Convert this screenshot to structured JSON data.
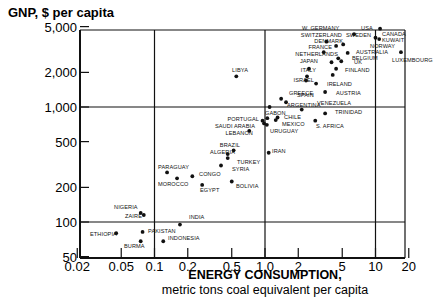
{
  "chart_data": {
    "type": "scatter",
    "title": "",
    "ylabel": "GNP, $ per capita",
    "xlabel": "ENERGY CONSUMPTION,",
    "xlabel_sub": "metric tons coal equivalent per capita",
    "xscale": "log",
    "yscale": "log",
    "xlim": [
      0.02,
      20
    ],
    "ylim": [
      50,
      5000
    ],
    "x_ticks": [
      {
        "value": 0.02,
        "label": "0.02"
      },
      {
        "value": 0.05,
        "label": "0.05"
      },
      {
        "value": 0.1,
        "label": "0.1"
      },
      {
        "value": 0.2,
        "label": "0.2"
      },
      {
        "value": 0.5,
        "label": "0.5"
      },
      {
        "value": 1.0,
        "label": "1.0"
      },
      {
        "value": 2,
        "label": "2"
      },
      {
        "value": 5,
        "label": "5"
      },
      {
        "value": 10,
        "label": "10"
      },
      {
        "value": 20,
        "label": "20"
      }
    ],
    "y_ticks": [
      {
        "value": 50,
        "label": "50"
      },
      {
        "value": 100,
        "label": "100"
      },
      {
        "value": 200,
        "label": "200"
      },
      {
        "value": 500,
        "label": "500"
      },
      {
        "value": 1000,
        "label": "1,000"
      },
      {
        "value": 2000,
        "label": "2,000"
      },
      {
        "value": 5000,
        "label": "5,000"
      }
    ],
    "gridlines": {
      "x": [
        0.1,
        1.0,
        10
      ],
      "y": [
        100,
        1000
      ]
    },
    "points": [
      {
        "name": "USA",
        "x": 11.0,
        "y": 4800
      },
      {
        "name": "CANADA",
        "x": 10.0,
        "y": 4000
      },
      {
        "name": "KUWAIT",
        "x": 10.8,
        "y": 3900
      },
      {
        "name": "LUXEMBOURG",
        "x": 17.0,
        "y": 3000
      },
      {
        "name": "W. GERMANY",
        "x": 5.1,
        "y": 3500
      },
      {
        "name": "SWITZERLAND",
        "x": 3.6,
        "y": 3700
      },
      {
        "name": "DENMARK",
        "x": 4.4,
        "y": 3400
      },
      {
        "name": "SWEDEN",
        "x": 6.4,
        "y": 4300
      },
      {
        "name": "FRANCE",
        "x": 3.4,
        "y": 3000
      },
      {
        "name": "NORWAY",
        "x": 5.6,
        "y": 2950
      },
      {
        "name": "AUSTRALIA",
        "x": 4.6,
        "y": 2650
      },
      {
        "name": "BELGIUM",
        "x": 4.9,
        "y": 2500
      },
      {
        "name": "NETHERLANDS",
        "x": 4.0,
        "y": 2450
      },
      {
        "name": "JAPAN",
        "x": 2.5,
        "y": 2150
      },
      {
        "name": "UK",
        "x": 4.4,
        "y": 2150
      },
      {
        "name": "FINLAND",
        "x": 4.1,
        "y": 1900
      },
      {
        "name": "ITALY",
        "x": 2.4,
        "y": 1850
      },
      {
        "name": "ISRAEL",
        "x": 2.35,
        "y": 1700
      },
      {
        "name": "IRELAND",
        "x": 2.9,
        "y": 1600
      },
      {
        "name": "AUSTRIA",
        "x": 3.5,
        "y": 1350
      },
      {
        "name": "LIBYA",
        "x": 0.55,
        "y": 1850
      },
      {
        "name": "GREECE",
        "x": 1.4,
        "y": 1180
      },
      {
        "name": "SPAIN",
        "x": 1.55,
        "y": 1100
      },
      {
        "name": "ARGENTINA",
        "x": 1.1,
        "y": 1000
      },
      {
        "name": "VENEZUELA",
        "x": 2.15,
        "y": 950
      },
      {
        "name": "TRINIDAD",
        "x": 3.5,
        "y": 880
      },
      {
        "name": "GABON",
        "x": 1.05,
        "y": 800
      },
      {
        "name": "CHILE",
        "x": 1.3,
        "y": 810
      },
      {
        "name": "MEXICO",
        "x": 1.25,
        "y": 770
      },
      {
        "name": "PORTUGAL",
        "x": 0.95,
        "y": 760
      },
      {
        "name": "SAUDI ARABIA",
        "x": 0.98,
        "y": 720
      },
      {
        "name": "URUGUAY",
        "x": 1.04,
        "y": 700
      },
      {
        "name": "S. AFRICA",
        "x": 2.85,
        "y": 760
      },
      {
        "name": "LEBANON",
        "x": 0.72,
        "y": 620
      },
      {
        "name": "BRAZIL",
        "x": 0.52,
        "y": 420
      },
      {
        "name": "ALGERIA",
        "x": 0.46,
        "y": 390
      },
      {
        "name": "TURKEY",
        "x": 0.46,
        "y": 360
      },
      {
        "name": "IRAN",
        "x": 1.08,
        "y": 400
      },
      {
        "name": "SYRIA",
        "x": 0.4,
        "y": 310
      },
      {
        "name": "PARAGUAY",
        "x": 0.13,
        "y": 270
      },
      {
        "name": "CONGO",
        "x": 0.22,
        "y": 250
      },
      {
        "name": "MOROCCO",
        "x": 0.16,
        "y": 240
      },
      {
        "name": "EGYPT",
        "x": 0.27,
        "y": 210
      },
      {
        "name": "BOLIVIA",
        "x": 0.5,
        "y": 225
      },
      {
        "name": "NIGERIA",
        "x": 0.075,
        "y": 120
      },
      {
        "name": "ZAIRE",
        "x": 0.08,
        "y": 115
      },
      {
        "name": "INDIA",
        "x": 0.17,
        "y": 95
      },
      {
        "name": "ETHIOPIA",
        "x": 0.045,
        "y": 80
      },
      {
        "name": "PAKISTAN",
        "x": 0.078,
        "y": 82
      },
      {
        "name": "BURMA",
        "x": 0.075,
        "y": 68
      },
      {
        "name": "INDONESIA",
        "x": 0.12,
        "y": 68
      }
    ]
  },
  "labels": [
    {
      "name": "USA",
      "lx": 361,
      "ly": 30,
      "anchor": "start"
    },
    {
      "name": "CANADA",
      "lx": 382,
      "ly": 36,
      "anchor": "start"
    },
    {
      "name": "KUWAIT",
      "lx": 382,
      "ly": 42,
      "anchor": "start"
    },
    {
      "name": "LUXEMBOURG",
      "lx": 392,
      "ly": 62,
      "anchor": "start"
    },
    {
      "name": "W. GERMANY",
      "lx": 302,
      "ly": 30,
      "anchor": "start"
    },
    {
      "name": "SWITZERLAND",
      "lx": 342,
      "ly": 37,
      "anchor": "end"
    },
    {
      "name": "DENMARK",
      "lx": 343,
      "ly": 43,
      "anchor": "end"
    },
    {
      "name": "SWEDEN",
      "lx": 346,
      "ly": 37,
      "anchor": "start"
    },
    {
      "name": "FRANCE",
      "lx": 332,
      "ly": 49,
      "anchor": "end"
    },
    {
      "name": "NORWAY",
      "lx": 370,
      "ly": 48,
      "anchor": "start"
    },
    {
      "name": "AUSTRALIA",
      "lx": 356,
      "ly": 54,
      "anchor": "start"
    },
    {
      "name": "BELGIUM",
      "lx": 352,
      "ly": 60,
      "anchor": "start"
    },
    {
      "name": "NETHERLANDS",
      "lx": 338,
      "ly": 56,
      "anchor": "end"
    },
    {
      "name": "JAPAN",
      "lx": 318,
      "ly": 63,
      "anchor": "end"
    },
    {
      "name": "UK",
      "lx": 354,
      "ly": 64,
      "anchor": "start"
    },
    {
      "name": "FINLAND",
      "lx": 345,
      "ly": 72,
      "anchor": "start"
    },
    {
      "name": "ITALY",
      "lx": 316,
      "ly": 72,
      "anchor": "end"
    },
    {
      "name": "ISRAEL",
      "lx": 314,
      "ly": 82,
      "anchor": "end"
    },
    {
      "name": "IRELAND",
      "lx": 327,
      "ly": 86,
      "anchor": "start"
    },
    {
      "name": "AUSTRIA",
      "lx": 336,
      "ly": 95,
      "anchor": "start"
    },
    {
      "name": "LIBYA",
      "lx": 248,
      "ly": 72,
      "anchor": "end"
    },
    {
      "name": "GREECE",
      "lx": 289,
      "ly": 95,
      "anchor": "start"
    },
    {
      "name": "SPAIN",
      "lx": 297,
      "ly": 97,
      "anchor": "start"
    },
    {
      "name": "ARGENTINA",
      "lx": 287,
      "ly": 107,
      "anchor": "start"
    },
    {
      "name": "VENEZUELA",
      "lx": 317,
      "ly": 105,
      "anchor": "start"
    },
    {
      "name": "TRINIDAD",
      "lx": 335,
      "ly": 114,
      "anchor": "start"
    },
    {
      "name": "GABON",
      "lx": 265,
      "ly": 115,
      "anchor": "start"
    },
    {
      "name": "CHILE",
      "lx": 284,
      "ly": 119,
      "anchor": "start"
    },
    {
      "name": "MEXICO",
      "lx": 282,
      "ly": 126,
      "anchor": "start"
    },
    {
      "name": "PORTUGAL",
      "lx": 259,
      "ly": 121,
      "anchor": "end"
    },
    {
      "name": "SAUDI ARABIA",
      "lx": 255,
      "ly": 128,
      "anchor": "end"
    },
    {
      "name": "URUGUAY",
      "lx": 270,
      "ly": 133,
      "anchor": "start"
    },
    {
      "name": "S. AFRICA",
      "lx": 316,
      "ly": 128,
      "anchor": "start"
    },
    {
      "name": "LEBANON",
      "lx": 253,
      "ly": 135,
      "anchor": "end"
    },
    {
      "name": "BRAZIL",
      "lx": 240,
      "ly": 147,
      "anchor": "end"
    },
    {
      "name": "ALGERIA",
      "lx": 235,
      "ly": 154,
      "anchor": "end"
    },
    {
      "name": "TURKEY",
      "lx": 237,
      "ly": 164,
      "anchor": "start"
    },
    {
      "name": "IRAN",
      "lx": 272,
      "ly": 153,
      "anchor": "start"
    },
    {
      "name": "SYRIA",
      "lx": 232,
      "ly": 171,
      "anchor": "start"
    },
    {
      "name": "PARAGUAY",
      "lx": 158,
      "ly": 169,
      "anchor": "start"
    },
    {
      "name": "CONGO",
      "lx": 199,
      "ly": 176,
      "anchor": "start"
    },
    {
      "name": "MOROCCO",
      "lx": 158,
      "ly": 186,
      "anchor": "start"
    },
    {
      "name": "EGYPT",
      "lx": 200,
      "ly": 192,
      "anchor": "start"
    },
    {
      "name": "BOLIVIA",
      "lx": 236,
      "ly": 188,
      "anchor": "start"
    },
    {
      "name": "NIGERIA",
      "lx": 114,
      "ly": 209,
      "anchor": "start"
    },
    {
      "name": "ZAIRE",
      "lx": 125,
      "ly": 218,
      "anchor": "start"
    },
    {
      "name": "INDIA",
      "lx": 189,
      "ly": 219,
      "anchor": "start"
    },
    {
      "name": "ETHIOPIA",
      "lx": 90,
      "ly": 236,
      "anchor": "start"
    },
    {
      "name": "PAKISTAN",
      "lx": 148,
      "ly": 233,
      "anchor": "start"
    },
    {
      "name": "BURMA",
      "lx": 124,
      "ly": 248,
      "anchor": "start"
    },
    {
      "name": "INDONESIA",
      "lx": 168,
      "ly": 240,
      "anchor": "start"
    }
  ],
  "colors": {
    "ink": "#111111",
    "background": "#ffffff"
  }
}
